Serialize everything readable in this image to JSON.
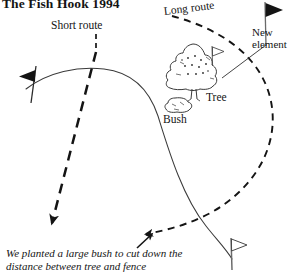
{
  "title": "The Fish Hook 1994",
  "labels": {
    "short_route": "Short route",
    "long_route": "Long route",
    "new_element": "New\nelement",
    "tree": "Tree",
    "bush": "Bush"
  },
  "caption": "We planted a large bush to cut down the\ndistance between tree and fence",
  "colors": {
    "ink": "#141414",
    "background": "#ffffff",
    "line": "#2b2b2b"
  },
  "diagram": {
    "type": "hand-drawn-sketch-map",
    "elements": [
      {
        "name": "flag-left",
        "kind": "flag",
        "fill": "solid",
        "direction": "left",
        "x": 32,
        "y": 76
      },
      {
        "name": "flag-top-right",
        "kind": "flag",
        "fill": "solid",
        "direction": "right",
        "x": 268,
        "y": 10
      },
      {
        "name": "flag-bottom",
        "kind": "flag",
        "fill": "outline",
        "direction": "right",
        "x": 232,
        "y": 244
      },
      {
        "name": "flag-tree",
        "kind": "flag",
        "fill": "outline",
        "direction": "right",
        "x": 214,
        "y": 50
      },
      {
        "name": "tree",
        "kind": "plant",
        "x": 193,
        "y": 68
      },
      {
        "name": "bush",
        "kind": "plant",
        "x": 175,
        "y": 104
      },
      {
        "name": "short-route-path",
        "kind": "dashed-arrow",
        "weight": "thick"
      },
      {
        "name": "long-route-path",
        "kind": "dashed-arrow",
        "weight": "medium"
      },
      {
        "name": "fence-curve",
        "kind": "solid-curve",
        "weight": "thin"
      }
    ]
  }
}
